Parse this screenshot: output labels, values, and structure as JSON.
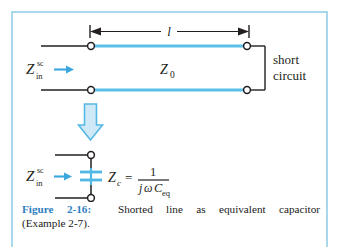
{
  "figure": {
    "number": "2-16",
    "label_prefix": "Figure 2-16:",
    "caption_main": "Shorted line as equivalent capacitor",
    "caption_second_line": "(Example 2-7).",
    "accent_color": "#5bc0e8",
    "label_color": "#2f7fc1",
    "frame_color": "#a8d8ea",
    "line_color": "#231f20"
  },
  "top_circuit": {
    "input_impedance": {
      "base": "Z",
      "superscript": "sc",
      "subscript": "in"
    },
    "length_label": "l",
    "characteristic_impedance": {
      "base": "Z",
      "subscript": "0"
    },
    "termination_label_line1": "short",
    "termination_label_line2": "circuit",
    "dimension_arrow": "double-headed",
    "node_count": 4
  },
  "transition": {
    "arrow_direction": "down",
    "arrow_style": "hollow-outline"
  },
  "bottom_circuit": {
    "input_impedance": {
      "base": "Z",
      "superscript": "sc",
      "subscript": "in"
    },
    "component": "capacitor",
    "equation": {
      "lhs_base": "Z",
      "lhs_subscript": "c",
      "equals": "=",
      "numerator": "1",
      "denominator_j": "j",
      "denominator_omega": "ω",
      "denominator_C": "C",
      "denominator_C_subscript": "eq"
    }
  }
}
